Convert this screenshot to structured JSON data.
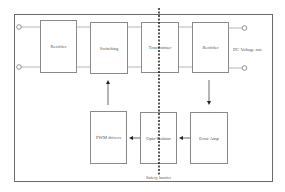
{
  "diagram": {
    "blocks": {
      "rectifier_in": "Rectifier",
      "switching": "Switching",
      "transformer": "Transformer",
      "rectifier_out": "Rectifier",
      "pwm_drivers": "PWM drivers",
      "opto_isolator": "Opto-Isolator",
      "error_amp": "Error Amp"
    },
    "labels": {
      "output": "DC Voltage out",
      "barrier": "Safety barrier"
    },
    "colors": {
      "line": "#8a8a8a",
      "frame": "#6a6a6a",
      "barrier": "#000000"
    }
  }
}
